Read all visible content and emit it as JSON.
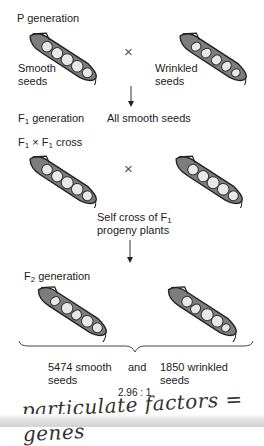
{
  "p_generation": {
    "label": "P generation",
    "left_parent": {
      "line1": "Smooth",
      "line2": "seeds",
      "seed_type": "smooth"
    },
    "right_parent": {
      "line1": "Wrinkled",
      "line2": "seeds",
      "seed_type": "wrinkled"
    },
    "cross_symbol": "×"
  },
  "f1_generation": {
    "label_prefix": "F",
    "label_sub": "1",
    "label_suffix": " generation",
    "result": "All smooth seeds"
  },
  "f1_cross": {
    "a": "F",
    "a_sub": "1",
    "x": " × ",
    "b": "F",
    "b_sub": "1",
    "suffix": " cross",
    "cross_symbol": "×",
    "note_line1_prefix": "Self cross of F",
    "note_line1_sub": "1",
    "note_line2": "progeny plants"
  },
  "f2_generation": {
    "label_prefix": "F",
    "label_sub": "2",
    "label_suffix": " generation",
    "smooth_line1": "5474 smooth",
    "smooth_line2": "seeds",
    "conjunction": "and",
    "wrinkled_line1": "1850 wrinkled",
    "wrinkled_line2": "seeds",
    "ratio": "2.96 : 1"
  },
  "handwritten_note": "particulate factors = genes",
  "colors": {
    "pod_outline": "#2a2a2a",
    "pod_fill": "#8a8a8a",
    "seed_fill": "#e6e6e6",
    "arrow": "#333333"
  }
}
